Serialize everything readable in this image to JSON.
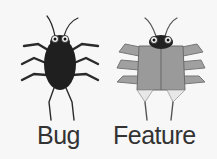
{
  "figures": [
    {
      "label": "Bug",
      "body_color": "#1f1f1f"
    },
    {
      "label": "Feature",
      "body_color": "#9a9a9a"
    }
  ]
}
